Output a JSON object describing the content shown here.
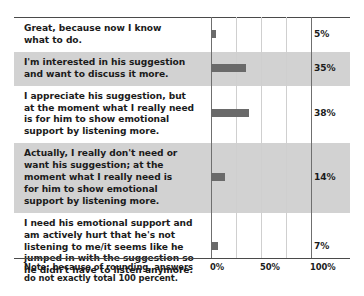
{
  "chart_data": {
    "type": "bar",
    "orientation": "horizontal",
    "title": "",
    "xlabel": "",
    "ylabel": "",
    "xlim": [
      0,
      100
    ],
    "grid": true,
    "legend": null,
    "tick_labels": [
      "0%",
      "50%",
      "100%"
    ],
    "tick_values": [
      0,
      50,
      100
    ],
    "gridline_values": [
      0,
      25,
      50,
      75,
      100
    ],
    "categories": [
      "Great, because now I know\nwhat to do.",
      "I'm interested in his suggestion\nand want to discuss it more.",
      "I appreciate his suggestion, but\nat the moment what I really need\nis for him to show emotional\nsupport by listening more.",
      "Actually, I really don't need or\nwant his suggestion; at the\nmoment what I really need is\nfor him to show emotional\nsupport by listening more.",
      "I need his emotional support and\nam actively hurt that he's not\nlistening to me/it seems like he\njumped in with the suggestion so\nhe didn't have to listen anymore."
    ],
    "values": [
      5,
      35,
      38,
      14,
      7
    ],
    "value_labels": [
      "5%",
      "35%",
      "38%",
      "14%",
      "7%"
    ],
    "annotation": "Note: because of rounding, answers\ndo not exactly total 100 percent."
  },
  "colors": {
    "bar": "#6a6a6a",
    "row_shade": "#d2d2d2",
    "row_plain": "#ffffff",
    "gridline": "#cfcfcf",
    "gridline_major": "#6f6f6f",
    "rule": "#4a4a4a",
    "text": "#1b1b1b",
    "background": "#ffffff"
  }
}
